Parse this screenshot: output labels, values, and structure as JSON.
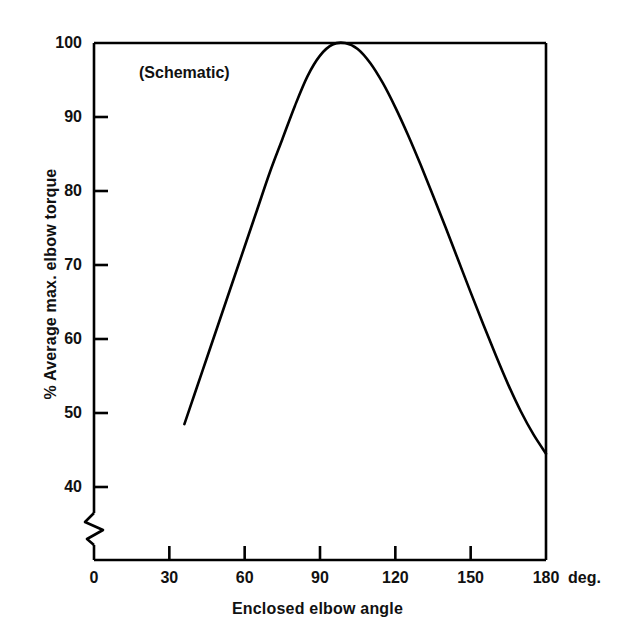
{
  "chart_data": {
    "type": "line",
    "title": "",
    "annotation": "(Schematic)",
    "xlabel": "Enclosed elbow angle",
    "ylabel": "% Average max. elbow torque",
    "x_unit_label": "deg.",
    "xlim": [
      0,
      180
    ],
    "ylim": [
      36,
      100
    ],
    "y_axis_break": true,
    "grid": false,
    "legend": null,
    "xticks": [
      0,
      30,
      60,
      90,
      120,
      150,
      180
    ],
    "xtick_labels": [
      "0",
      "30",
      "60",
      "90",
      "120",
      "150",
      "180"
    ],
    "yticks": [
      40,
      50,
      60,
      70,
      80,
      90,
      100
    ],
    "ytick_labels": [
      "40",
      "50",
      "60",
      "70",
      "80",
      "90",
      "100"
    ],
    "series": [
      {
        "name": "Average max. elbow torque",
        "color": "#000000",
        "x": [
          36,
          40,
          45,
          50,
          55,
          60,
          65,
          70,
          75,
          80,
          85,
          90,
          95,
          100,
          105,
          110,
          115,
          120,
          125,
          130,
          135,
          140,
          145,
          150,
          155,
          160,
          165,
          170,
          175,
          180
        ],
        "y": [
          48.5,
          52.5,
          57.5,
          62.5,
          67.5,
          72.5,
          77.5,
          82.5,
          87.0,
          91.5,
          95.5,
          98.3,
          99.8,
          100.0,
          99.2,
          97.3,
          94.6,
          91.3,
          87.6,
          83.6,
          79.4,
          75.1,
          70.7,
          66.3,
          62.0,
          57.8,
          53.8,
          50.2,
          47.1,
          44.5
        ]
      }
    ],
    "peak": {
      "x": 100,
      "y": 100
    },
    "start_point": {
      "x": 36,
      "y": 48.5
    },
    "end_point": {
      "x": 180,
      "y": 44.5
    }
  },
  "style": {
    "line_color": "#000000",
    "axis_color": "#000000",
    "background": "#ffffff"
  }
}
